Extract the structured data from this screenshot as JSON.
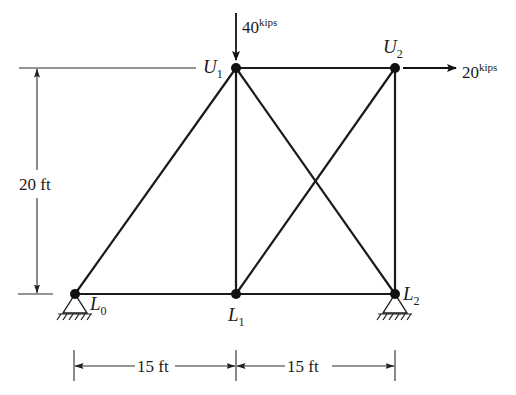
{
  "diagram": {
    "type": "truss",
    "joints": [
      {
        "id": "L0",
        "base": "L",
        "sub": "0",
        "x": 75,
        "y": 294
      },
      {
        "id": "L1",
        "base": "L",
        "sub": "1",
        "x": 236,
        "y": 294
      },
      {
        "id": "L2",
        "base": "L",
        "sub": "2",
        "x": 395,
        "y": 294
      },
      {
        "id": "U1",
        "base": "U",
        "sub": "1",
        "x": 236,
        "y": 68
      },
      {
        "id": "U2",
        "base": "U",
        "sub": "2",
        "x": 395,
        "y": 68
      }
    ],
    "members": [
      [
        "L0",
        "L1"
      ],
      [
        "L1",
        "L2"
      ],
      [
        "U1",
        "U2"
      ],
      [
        "L0",
        "U1"
      ],
      [
        "U1",
        "L1"
      ],
      [
        "U2",
        "L2"
      ],
      [
        "U1",
        "L2"
      ],
      [
        "L1",
        "U2"
      ]
    ],
    "supports": [
      {
        "joint": "L0",
        "type": "pin"
      },
      {
        "joint": "L2",
        "type": "pin"
      }
    ],
    "loads": [
      {
        "joint": "U1",
        "direction": "down",
        "value": "40",
        "unit": "kips"
      },
      {
        "joint": "U2",
        "direction": "right",
        "value": "20",
        "unit": "kips"
      }
    ],
    "dimensions": {
      "height": {
        "label": "20 ft"
      },
      "spans": [
        {
          "label": "15 ft"
        },
        {
          "label": "15 ft"
        }
      ]
    }
  }
}
